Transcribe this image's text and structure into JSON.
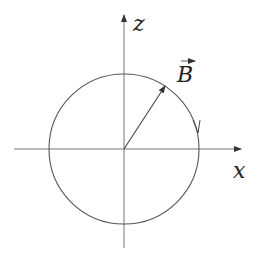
{
  "diagram": {
    "axes": {
      "x_label": "x",
      "z_label": "z",
      "origin": [
        124,
        149
      ]
    },
    "circle": {
      "cx": 124,
      "cy": 149,
      "r": 75,
      "direction": "clockwise"
    },
    "vector": {
      "label": "B",
      "has_overarrow": true,
      "angle_deg": 57
    },
    "colors": {
      "stroke": "#555555",
      "text": "#222222"
    }
  }
}
